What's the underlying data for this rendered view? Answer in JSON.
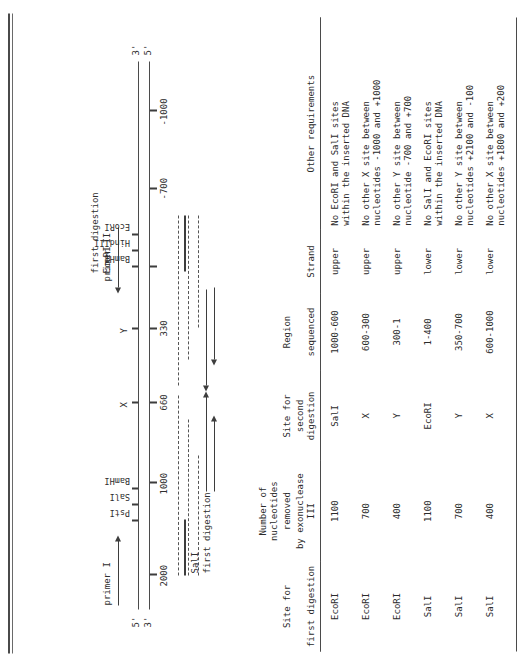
{
  "diagram": {
    "title_primer1": "primer I",
    "title_primer2": "primer II",
    "strand_top_left": "5'",
    "strand_bottom_left": "3'",
    "strand_top_right": "3'",
    "strand_bottom_right": "5'",
    "scale_ticks": [
      {
        "label": "2000"
      },
      {
        "label": "1000"
      },
      {
        "label": "660"
      },
      {
        "label": "330"
      },
      {
        "label": "-700"
      },
      {
        "label": "-1000"
      }
    ],
    "site_labels_left": [
      "PstI",
      "SalI",
      "BamHI"
    ],
    "site_labels_right": [
      "BamHI",
      "HindIII",
      "EcoRI"
    ],
    "marker_x": "X",
    "marker_y": "Y",
    "digestion_left": "SalI",
    "digestion_left_sub": "first digestion",
    "digestion_right": "EcoRI",
    "digestion_right_sub": "first digestion"
  },
  "table": {
    "headers": [
      {
        "line1": "Site for",
        "line2": "first digestion"
      },
      {
        "line0": "Number of nucleotides",
        "line1": "removed",
        "line2": "by exonuclease III"
      },
      {
        "line1": "Site for",
        "line2": "second digestion"
      },
      {
        "line1": "Region",
        "line2": "sequenced"
      },
      {
        "line1": "",
        "line2": "Strand"
      },
      {
        "line1": "",
        "line2": "Other requirements"
      }
    ],
    "rows": [
      {
        "first_site": "EcoRI",
        "removed": "1100",
        "second_site": "SalI",
        "region": "1000-600",
        "strand": "upper",
        "requirement_1": "No EcoRI and SalI sites",
        "requirement_2": "within the inserted DNA"
      },
      {
        "first_site": "EcoRI",
        "removed": "700",
        "second_site": "X",
        "region": "600-300",
        "strand": "upper",
        "requirement_1": "No other X site between",
        "requirement_2": "nucleotides -1000 and +1000"
      },
      {
        "first_site": "EcoRI",
        "removed": "400",
        "second_site": "Y",
        "region": "300-1",
        "strand": "upper",
        "requirement_1": "No other Y site between",
        "requirement_2": "nucleotide -700 and +700"
      },
      {
        "first_site": "SalI",
        "removed": "1100",
        "second_site": "EcoRI",
        "region": "1-400",
        "strand": "lower",
        "requirement_1": "No SalI and EcoRI sites",
        "requirement_2": "within the inserted DNA"
      },
      {
        "first_site": "SalI",
        "removed": "700",
        "second_site": "Y",
        "region": "350-700",
        "strand": "lower",
        "requirement_1": "No other Y site between",
        "requirement_2": "nucleotides +2100 and -100"
      },
      {
        "first_site": "SalI",
        "removed": "400",
        "second_site": "X",
        "region": "600-1000",
        "strand": "lower",
        "requirement_1": "No other X site between",
        "requirement_2": "nucleotides +1800 and +200"
      }
    ]
  }
}
